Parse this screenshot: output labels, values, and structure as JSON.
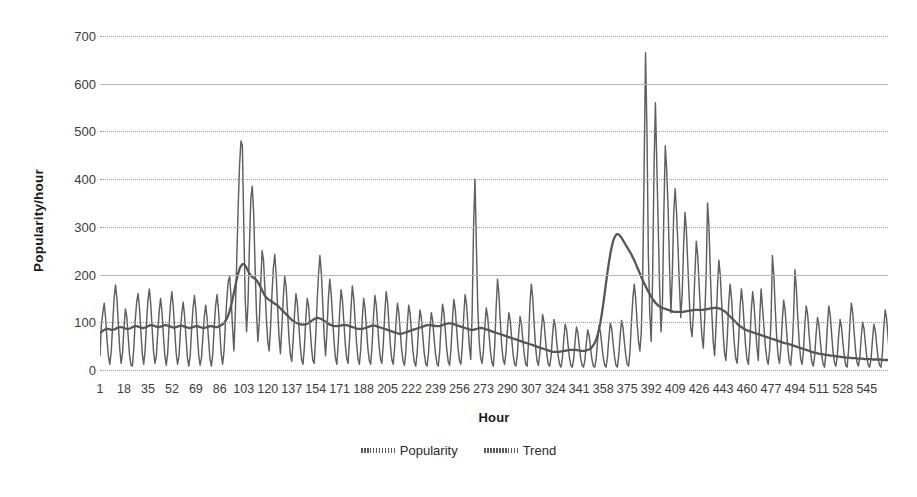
{
  "chart_data": {
    "type": "line",
    "title": "",
    "xlabel": "Hour",
    "ylabel": "Popularity/hour",
    "xlim": [
      1,
      560
    ],
    "ylim": [
      0,
      700
    ],
    "yticks": [
      0,
      100,
      200,
      300,
      400,
      500,
      600,
      700
    ],
    "ytick_labels": [
      "0",
      "100",
      "200",
      "300",
      "400",
      "500",
      "600",
      "700"
    ],
    "xticks": [
      1,
      18,
      35,
      52,
      69,
      86,
      103,
      120,
      137,
      154,
      171,
      188,
      205,
      222,
      239,
      256,
      273,
      290,
      307,
      324,
      341,
      358,
      375,
      392,
      409,
      426,
      443,
      460,
      477,
      494,
      511,
      528,
      545
    ],
    "xtick_labels": [
      "1",
      "18",
      "35",
      "52",
      "69",
      "86",
      "103",
      "120",
      "137",
      "154",
      "171",
      "188",
      "205",
      "222",
      "239",
      "256",
      "273",
      "290",
      "307",
      "324",
      "341",
      "358",
      "375",
      "392",
      "409",
      "426",
      "443",
      "460",
      "477",
      "494",
      "511",
      "528",
      "545"
    ],
    "grid": true,
    "grid_axis": "y",
    "legend": [
      "Popularity",
      "Trend"
    ],
    "legend_position": "bottom",
    "line_color": "#5f5f5f",
    "trend_color": "#565656",
    "background": "#ffffff",
    "annotations": [
      {
        "text": "peak ~480 near hour 104",
        "x": 104,
        "y": 480
      },
      {
        "text": "isolated spike 400 near hour 276",
        "x": 276,
        "y": 400
      },
      {
        "text": "maximum ~665 near hour 395",
        "x": 395,
        "y": 665
      },
      {
        "text": "secondary peak ~560 near hour 404",
        "x": 404,
        "y": 560
      }
    ],
    "series": [
      {
        "name": "Popularity",
        "x_start": 1,
        "x_step": 1,
        "values": [
          30,
          95,
          120,
          140,
          108,
          62,
          28,
          12,
          40,
          96,
          150,
          178,
          150,
          96,
          44,
          14,
          36,
          88,
          128,
          112,
          70,
          30,
          10,
          8,
          46,
          104,
          142,
          160,
          130,
          80,
          34,
          12,
          40,
          98,
          146,
          170,
          138,
          86,
          38,
          14,
          30,
          80,
          124,
          150,
          120,
          72,
          30,
          10,
          34,
          92,
          138,
          164,
          132,
          84,
          36,
          12,
          28,
          78,
          118,
          142,
          114,
          68,
          26,
          8,
          30,
          86,
          130,
          156,
          126,
          78,
          32,
          10,
          26,
          70,
          112,
          136,
          108,
          64,
          24,
          8,
          32,
          90,
          134,
          158,
          128,
          80,
          34,
          12,
          40,
          100,
          150,
          186,
          196,
          150,
          90,
          40,
          120,
          230,
          340,
          430,
          480,
          470,
          300,
          150,
          80,
          140,
          260,
          360,
          385,
          330,
          220,
          120,
          60,
          100,
          180,
          250,
          230,
          170,
          110,
          60,
          40,
          90,
          160,
          214,
          242,
          198,
          130,
          70,
          34,
          90,
          150,
          196,
          176,
          124,
          70,
          32,
          18,
          60,
          118,
          160,
          140,
          96,
          52,
          22,
          12,
          48,
          108,
          150,
          134,
          90,
          48,
          20,
          14,
          70,
          140,
          200,
          240,
          204,
          140,
          72,
          30,
          80,
          150,
          190,
          160,
          110,
          60,
          26,
          12,
          56,
          120,
          168,
          146,
          100,
          54,
          24,
          14,
          62,
          126,
          176,
          150,
          102,
          56,
          24,
          12,
          44,
          104,
          150,
          130,
          88,
          46,
          20,
          12,
          50,
          110,
          156,
          136,
          92,
          50,
          22,
          14,
          56,
          118,
          164,
          142,
          96,
          52,
          22,
          12,
          46,
          100,
          140,
          120,
          80,
          42,
          18,
          10,
          40,
          96,
          136,
          118,
          78,
          40,
          16,
          8,
          36,
          88,
          126,
          108,
          70,
          36,
          14,
          8,
          34,
          84,
          120,
          104,
          66,
          34,
          14,
          8,
          40,
          96,
          138,
          120,
          80,
          42,
          18,
          10,
          44,
          104,
          148,
          128,
          86,
          46,
          20,
          12,
          48,
          112,
          158,
          138,
          94,
          50,
          22,
          120,
          300,
          400,
          260,
          130,
          60,
          26,
          14,
          40,
          90,
          130,
          112,
          74,
          38,
          16,
          8,
          50,
          130,
          190,
          160,
          100,
          50,
          22,
          12,
          36,
          84,
          120,
          104,
          68,
          34,
          14,
          8,
          30,
          76,
          112,
          96,
          62,
          32,
          12,
          8,
          60,
          140,
          180,
          150,
          95,
          48,
          20,
          10,
          34,
          80,
          116,
          100,
          64,
          32,
          12,
          8,
          28,
          72,
          106,
          92,
          58,
          30,
          12,
          6,
          24,
          64,
          96,
          84,
          54,
          26,
          10,
          6,
          22,
          60,
          90,
          78,
          50,
          24,
          10,
          6,
          20,
          56,
          84,
          72,
          46,
          22,
          8,
          6,
          24,
          62,
          92,
          80,
          52,
          26,
          10,
          6,
          28,
          68,
          98,
          86,
          56,
          28,
          10,
          6,
          30,
          72,
          104,
          90,
          58,
          30,
          12,
          8,
          40,
          100,
          150,
          180,
          150,
          100,
          60,
          40,
          80,
          200,
          420,
          665,
          500,
          240,
          120,
          60,
          190,
          420,
          560,
          430,
          300,
          170,
          80,
          140,
          330,
          470,
          420,
          340,
          220,
          120,
          200,
          330,
          380,
          330,
          260,
          180,
          110,
          160,
          260,
          330,
          290,
          220,
          150,
          90,
          70,
          120,
          200,
          270,
          240,
          180,
          120,
          70,
          46,
          110,
          200,
          350,
          300,
          200,
          120,
          60,
          30,
          90,
          170,
          230,
          200,
          140,
          80,
          36,
          20,
          70,
          140,
          180,
          150,
          100,
          54,
          24,
          14,
          60,
          130,
          170,
          140,
          94,
          50,
          22,
          12,
          56,
          124,
          164,
          136,
          90,
          48,
          20,
          110,
          170,
          130,
          90,
          50,
          24,
          12,
          40,
          100,
          240,
          200,
          130,
          70,
          30,
          14,
          44,
          104,
          146,
          126,
          84,
          44,
          18,
          10,
          46,
          110,
          210,
          170,
          110,
          58,
          24,
          12,
          38,
          94,
          134,
          116,
          76,
          40,
          16,
          8,
          30,
          76,
          110,
          94,
          60,
          30,
          12,
          6,
          36,
          92,
          134,
          116,
          76,
          38,
          16,
          8,
          28,
          72,
          106,
          90,
          58,
          28,
          10,
          6,
          40,
          100,
          140,
          120,
          78,
          40,
          16,
          8,
          26,
          68,
          100,
          86,
          54,
          26,
          10,
          6,
          24,
          64,
          96,
          82,
          52,
          24,
          10,
          6,
          34,
          88,
          126,
          108,
          70,
          34,
          14,
          8,
          22,
          60,
          90,
          76,
          48,
          22,
          8,
          6,
          30,
          80,
          116,
          100,
          64,
          30,
          12,
          6,
          20,
          56,
          84,
          70,
          44,
          20,
          8,
          6,
          26,
          70,
          104,
          88,
          56,
          26,
          10,
          6,
          18,
          52,
          80,
          68,
          42,
          20,
          8,
          6,
          22,
          62,
          92,
          78,
          48,
          22,
          8,
          6,
          28,
          74,
          108,
          92,
          58,
          28,
          10,
          6,
          20,
          56,
          86,
          72,
          44,
          20,
          8,
          24,
          66,
          98,
          84,
          52,
          24,
          10,
          30
        ]
      },
      {
        "name": "Trend",
        "x_start": 1,
        "x_step": 1,
        "values": [
          78,
          80,
          82,
          84,
          85,
          86,
          86,
          85,
          84,
          84,
          85,
          86,
          88,
          89,
          90,
          90,
          89,
          88,
          87,
          86,
          86,
          87,
          88,
          90,
          91,
          92,
          92,
          91,
          90,
          89,
          88,
          88,
          89,
          90,
          92,
          93,
          94,
          94,
          93,
          92,
          91,
          90,
          90,
          91,
          92,
          93,
          94,
          94,
          93,
          92,
          91,
          90,
          89,
          89,
          90,
          91,
          92,
          93,
          93,
          92,
          91,
          90,
          89,
          88,
          88,
          89,
          90,
          91,
          92,
          92,
          91,
          90,
          89,
          88,
          88,
          89,
          90,
          91,
          92,
          92,
          91,
          91,
          90,
          90,
          91,
          92,
          94,
          96,
          99,
          103,
          108,
          115,
          124,
          135,
          148,
          162,
          176,
          190,
          202,
          212,
          218,
          222,
          222,
          219,
          214,
          208,
          202,
          198,
          195,
          193,
          191,
          188,
          184,
          179,
          173,
          167,
          161,
          156,
          152,
          149,
          147,
          145,
          143,
          141,
          139,
          137,
          135,
          132,
          129,
          126,
          123,
          120,
          117,
          114,
          111,
          108,
          105,
          103,
          101,
          99,
          98,
          97,
          96,
          95,
          95,
          95,
          96,
          97,
          99,
          101,
          103,
          105,
          107,
          108,
          109,
          109,
          108,
          107,
          105,
          103,
          101,
          99,
          97,
          95,
          94,
          93,
          92,
          92,
          92,
          92,
          93,
          93,
          94,
          94,
          94,
          94,
          93,
          92,
          91,
          90,
          89,
          88,
          87,
          86,
          86,
          86,
          86,
          87,
          88,
          89,
          90,
          91,
          92,
          93,
          93,
          93,
          92,
          91,
          90,
          89,
          88,
          87,
          86,
          85,
          84,
          83,
          82,
          81,
          80,
          79,
          78,
          77,
          76,
          76,
          76,
          77,
          78,
          79,
          80,
          81,
          82,
          83,
          84,
          85,
          86,
          87,
          88,
          89,
          90,
          91,
          92,
          93,
          94,
          94,
          94,
          94,
          93,
          93,
          92,
          92,
          92,
          92,
          93,
          94,
          95,
          96,
          97,
          98,
          98,
          98,
          97,
          96,
          95,
          94,
          93,
          92,
          91,
          90,
          89,
          88,
          87,
          86,
          85,
          84,
          84,
          84,
          85,
          86,
          87,
          88,
          88,
          88,
          87,
          86,
          85,
          84,
          83,
          82,
          81,
          80,
          79,
          78,
          77,
          76,
          75,
          74,
          73,
          72,
          71,
          70,
          69,
          68,
          67,
          66,
          65,
          64,
          63,
          62,
          61,
          60,
          59,
          58,
          57,
          56,
          55,
          54,
          53,
          52,
          51,
          50,
          49,
          48,
          47,
          46,
          45,
          44,
          43,
          42,
          41,
          40,
          39,
          38,
          38,
          38,
          38,
          38,
          38,
          39,
          39,
          40,
          40,
          41,
          41,
          42,
          42,
          42,
          42,
          42,
          42,
          41,
          41,
          40,
          40,
          40,
          40,
          41,
          42,
          43,
          45,
          48,
          52,
          57,
          64,
          73,
          85,
          100,
          118,
          138,
          160,
          183,
          205,
          225,
          243,
          258,
          270,
          278,
          283,
          285,
          284,
          281,
          277,
          272,
          267,
          262,
          257,
          252,
          247,
          242,
          236,
          230,
          223,
          216,
          209,
          202,
          195,
          188,
          182,
          176,
          170,
          164,
          159,
          154,
          149,
          145,
          141,
          138,
          135,
          133,
          131,
          130,
          129,
          128,
          127,
          126,
          125,
          124,
          123,
          122,
          122,
          122,
          122,
          122,
          122,
          122,
          122,
          123,
          123,
          124,
          124,
          125,
          125,
          126,
          126,
          126,
          126,
          126,
          126,
          126,
          126,
          127,
          127,
          128,
          128,
          129,
          129,
          130,
          130,
          130,
          130,
          129,
          128,
          127,
          125,
          123,
          121,
          118,
          115,
          112,
          109,
          106,
          103,
          100,
          97,
          94,
          92,
          90,
          88,
          86,
          84,
          83,
          82,
          81,
          80,
          79,
          78,
          77,
          76,
          75,
          74,
          73,
          72,
          71,
          70,
          69,
          68,
          67,
          66,
          65,
          64,
          63,
          62,
          61,
          60,
          59,
          58,
          57,
          56,
          56,
          55,
          54,
          53,
          52,
          51,
          50,
          49,
          48,
          47,
          46,
          45,
          44,
          43,
          42,
          41,
          40,
          39,
          38,
          37,
          36,
          36,
          35,
          34,
          34,
          33,
          33,
          32,
          32,
          31,
          31,
          30,
          30,
          30,
          29,
          29,
          28,
          28,
          28,
          27,
          27,
          27,
          26,
          26,
          26,
          26,
          25,
          25,
          25,
          25,
          24,
          24,
          24,
          24,
          24,
          23,
          23,
          23,
          23,
          23,
          23,
          22,
          22,
          22,
          22,
          22,
          22,
          22,
          21,
          21,
          21,
          21,
          21,
          21,
          21,
          21,
          22,
          22,
          22,
          23
        ]
      }
    ]
  },
  "legend": {
    "items": [
      {
        "label": "Popularity",
        "icon": "dotted-line-swatch"
      },
      {
        "label": "Trend",
        "icon": "dotted-line-swatch"
      }
    ]
  }
}
